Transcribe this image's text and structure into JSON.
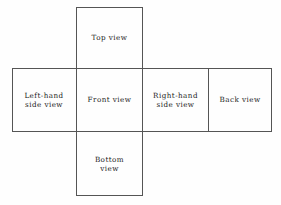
{
  "diagram": {
    "type": "cross-layout-view-arrangement",
    "stroke_color": "#555555",
    "text_color": "#1b1b1b",
    "background_color": "#fefefe",
    "cells": [
      {
        "id": "top",
        "label": "Top view",
        "row": "top",
        "column": "center"
      },
      {
        "id": "left",
        "label": "Left-hand\nside view",
        "row": "middle",
        "column": "first"
      },
      {
        "id": "front",
        "label": "Front view",
        "row": "middle",
        "column": "second"
      },
      {
        "id": "right",
        "label": "Right-hand\nside view",
        "row": "middle",
        "column": "third"
      },
      {
        "id": "back",
        "label": "Back view",
        "row": "middle",
        "column": "fourth"
      },
      {
        "id": "bottom",
        "label": "Bottom\nview",
        "row": "bottom",
        "column": "center"
      }
    ]
  }
}
